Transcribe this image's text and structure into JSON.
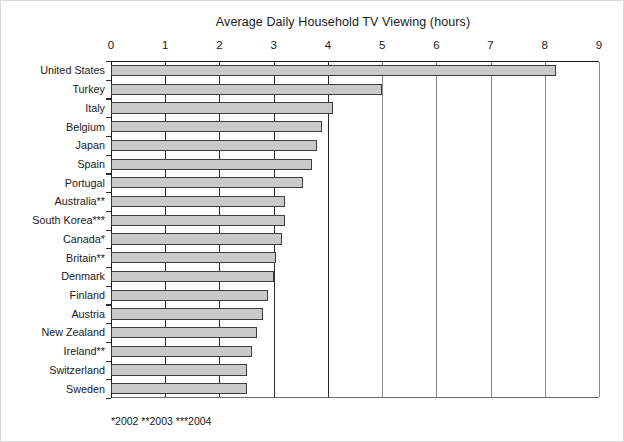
{
  "chart_data": {
    "type": "bar",
    "orientation": "horizontal",
    "title": "Average Daily Household TV Viewing (hours)",
    "xlabel": "",
    "ylabel": "",
    "xlim": [
      0,
      9
    ],
    "ylim": null,
    "grid": true,
    "legend": null,
    "xticks": [
      "0",
      "1",
      "2",
      "3",
      "4",
      "5",
      "6",
      "7",
      "8",
      "9"
    ],
    "categories": [
      "United States",
      "Turkey",
      "Italy",
      "Belgium",
      "Japan",
      "Spain",
      "Portugal",
      "Australia**",
      "South Korea***",
      "Canada*",
      "Britain**",
      "Denmark",
      "Finland",
      "Austria",
      "New Zealand",
      "Ireland**",
      "Switzerland",
      "Sweden"
    ],
    "values": [
      8.2,
      5.0,
      4.1,
      3.9,
      3.8,
      3.7,
      3.55,
      3.2,
      3.2,
      3.15,
      3.05,
      3.0,
      2.9,
      2.8,
      2.7,
      2.6,
      2.5,
      2.5
    ],
    "annotations": [
      "*2002 **2003 ***2004"
    ],
    "bar_fill_color": "#c9c9c9",
    "bar_border_color": "#3c3c3c",
    "axis_color": "#1a1a1a"
  },
  "footnote": "*2002 **2003 ***2004"
}
